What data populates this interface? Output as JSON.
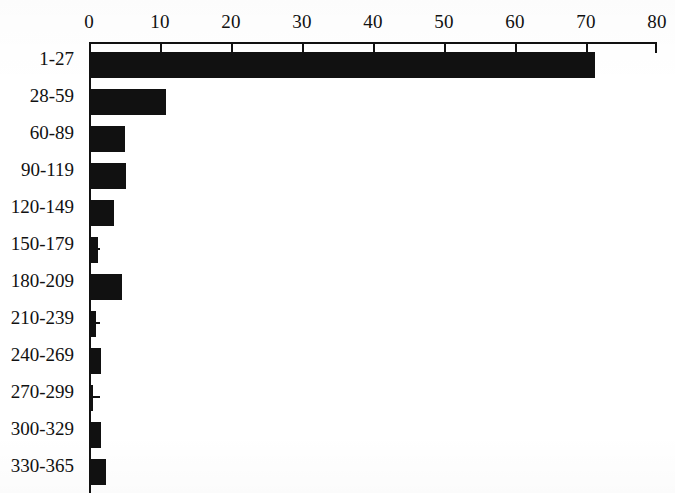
{
  "chart_data": {
    "type": "bar",
    "orientation": "horizontal",
    "title": "",
    "xlabel": "",
    "ylabel": "",
    "xlim": [
      0,
      80
    ],
    "ylim": null,
    "grid": false,
    "legend": null,
    "bar_color": "#111111",
    "axis_color": "#111111",
    "background_color": "#ffffff",
    "x_ticks": [
      0,
      10,
      20,
      30,
      40,
      50,
      60,
      70,
      80
    ],
    "x_tick_labels": [
      "0",
      "10",
      "20",
      "30",
      "40",
      "50",
      "60",
      "70",
      "80"
    ],
    "x_axis_position": "top",
    "categories": [
      "1-27",
      "28-59",
      "60-89",
      "90-119",
      "120-149",
      "150-179",
      "180-209",
      "210-239",
      "240-269",
      "270-299",
      "300-329",
      "330-365"
    ],
    "values": [
      71,
      10.5,
      4.8,
      4.9,
      3.2,
      1,
      4.4,
      0.7,
      1.4,
      0.3,
      1.4,
      2.1
    ]
  }
}
